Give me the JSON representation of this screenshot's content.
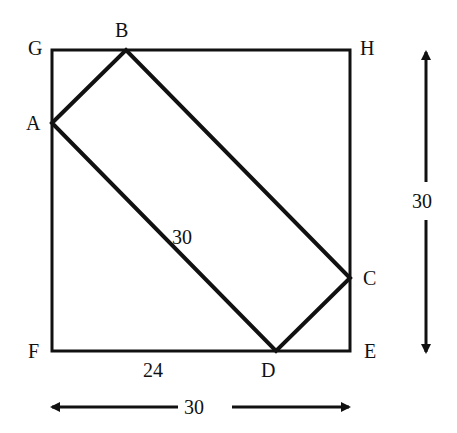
{
  "diagram": {
    "points": {
      "G": {
        "label": "G",
        "x": 52,
        "y": 50
      },
      "B": {
        "label": "B",
        "x": 126,
        "y": 50
      },
      "H": {
        "label": "H",
        "x": 350,
        "y": 50
      },
      "A": {
        "label": "A",
        "x": 52,
        "y": 123
      },
      "C": {
        "label": "C",
        "x": 350,
        "y": 278
      },
      "F": {
        "label": "F",
        "x": 52,
        "y": 351
      },
      "D": {
        "label": "D",
        "x": 276,
        "y": 351
      },
      "E": {
        "label": "E",
        "x": 350,
        "y": 351
      }
    },
    "labels": {
      "diagonal_length": "30",
      "fd_length": "24",
      "width_dimension": "30",
      "height_dimension": "30"
    },
    "colors": {
      "stroke": "#111111",
      "background": "#ffffff"
    }
  }
}
